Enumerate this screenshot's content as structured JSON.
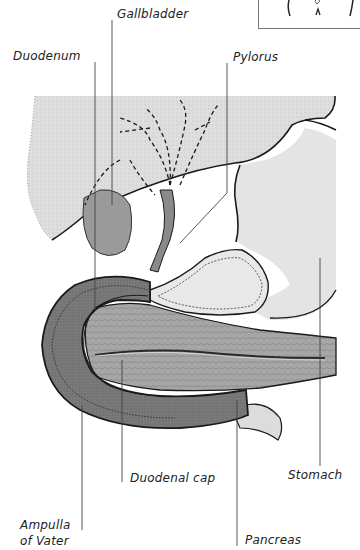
{
  "diagram": {
    "labels": {
      "gallbladder": "Gallbladder",
      "duodenum": "Duodenum",
      "pylorus": "Pylorus",
      "stomach": "Stomach",
      "duodenal_cap": "Duodenal cap",
      "ampulla_line1": "Ampulla",
      "ampulla_line2": "of Vater",
      "pancreas": "Pancreas"
    },
    "inset": "body-orientation-thumbnail",
    "colors": {
      "liver_fill": "#dcdcdc",
      "stomach_fill": "#e2e2e2",
      "duodenum_fill": "#7a7a7a",
      "pancreas_fill": "#a8a8a8",
      "gallbladder_fill": "#9a9a9a",
      "outline": "#1a1a1a",
      "leader_line": "#444444"
    }
  }
}
